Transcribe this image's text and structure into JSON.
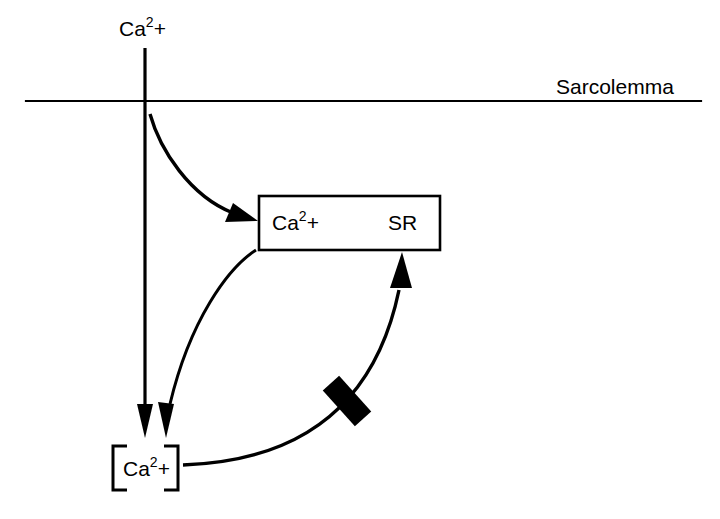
{
  "diagram": {
    "background_color": "#ffffff",
    "stroke_color": "#000000",
    "labels": {
      "extracellular_calcium": {
        "base": "Ca",
        "superscript": "2",
        "charge": "+"
      },
      "membrane": "Sarcolemma",
      "sr_store_calcium": {
        "base": "Ca",
        "superscript": "2",
        "charge": "+"
      },
      "sr_compartment": "SR",
      "cytosolic_calcium": {
        "bracket_open": "[",
        "base": "Ca",
        "superscript": "2",
        "charge": "+",
        "bracket_close": "]"
      }
    },
    "elements": {
      "membrane_line": "sarcolemma-line",
      "sr_box": "sarcoplasmic-reticulum-box",
      "influx_arrow": "calcium-influx-arrow",
      "uptake_arrow": "sr-uptake-curved-arrow",
      "release_arrow": "sr-release-curved-arrow",
      "feedback_arrow": "cytosolic-feedback-arrow",
      "inhibition_marker": "inhibition-bar"
    }
  }
}
